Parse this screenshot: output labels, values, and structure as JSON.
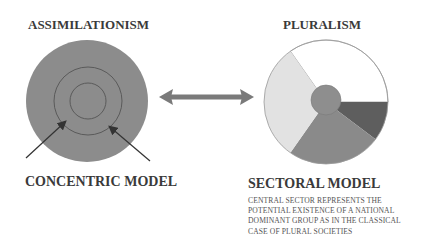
{
  "left": {
    "title": "ASSIMILATIONISM",
    "model_label": "CONCENTRIC MODEL",
    "colors": {
      "fill": "#8c8c8c",
      "ring_stroke": "#5a5a5a",
      "arrow": "#333333"
    }
  },
  "right": {
    "title": "PLURALISM",
    "model_label": "SECTORAL MODEL",
    "description": [
      "CENTRAL SECTOR REPRESENTS THE",
      "POTENTIAL EXISTENCE OF A NATIONAL",
      "DOMINANT GROUP AS IN THE CLASSICAL",
      "CASE OF PLURAL SOCIETIES"
    ],
    "sectors": [
      {
        "name": "white",
        "color": "#ffffff"
      },
      {
        "name": "dark",
        "color": "#5e5e5e"
      },
      {
        "name": "medium",
        "color": "#8a8a8a"
      },
      {
        "name": "light",
        "color": "#e2e2e2"
      },
      {
        "name": "central",
        "color": "#8e8e8e"
      }
    ]
  },
  "connector": {
    "type": "double-arrow",
    "color": "#7a7a7a"
  }
}
